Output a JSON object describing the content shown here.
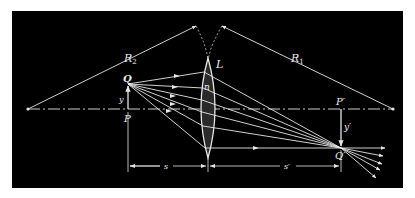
{
  "diagram": {
    "colors": {
      "background": "#000000",
      "line": "#e6e6e6",
      "lens_fill": "#2a2a2a",
      "page": "#ffffff"
    },
    "labels": {
      "R2": "R",
      "R2_sub": "2",
      "R1": "R",
      "R1_sub": "1",
      "lens": "L",
      "index": "n",
      "Q": "Q",
      "P": "P",
      "y": "y",
      "P_prime": "P′",
      "Q_prime": "Q′",
      "y_prime": "y′",
      "s": "s",
      "s_prime": "s′"
    },
    "elements": [
      "optical-axis (dash-dot)",
      "biconvex lens L with index n",
      "object arrow PQ of height y",
      "image arrow P'Q' of height y' (inverted)",
      "radius lines R1 and R2 from centers of curvature",
      "ray fan from Q converging to Q'",
      "distance markers s and s'"
    ]
  }
}
